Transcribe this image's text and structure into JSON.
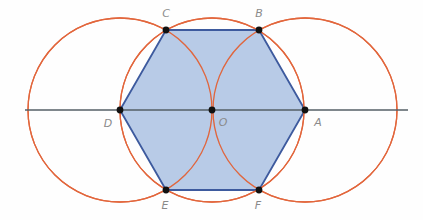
{
  "figure": {
    "width": 423,
    "height": 220
  },
  "colors": {
    "background": "#fefefe",
    "arc_stroke": "#e2663c",
    "hexagon_fill": "#aec4e4",
    "hexagon_stroke": "#3d5a9e",
    "axis_line": "#555f66",
    "point_fill": "#111111",
    "label_text": "#8a8a8a"
  },
  "axis": {
    "name": "horizontal-diameter-line",
    "x1": 25,
    "y1": 110,
    "x2": 408,
    "y2": 110
  },
  "center": {
    "label": "O",
    "x": 212,
    "y": 110,
    "label_x": 223,
    "label_y": 123
  },
  "radius": 92,
  "circles": [
    {
      "name": "circle-center-O",
      "cx": 212,
      "cy": 110,
      "r": 92
    },
    {
      "name": "circle-center-D",
      "cx": 120,
      "cy": 110,
      "r": 92
    },
    {
      "name": "circle-center-A",
      "cx": 305,
      "cy": 110,
      "r": 92
    }
  ],
  "vertices": [
    {
      "label": "A",
      "x": 305,
      "y": 110,
      "label_x": 318,
      "label_y": 123
    },
    {
      "label": "B",
      "x": 259,
      "y": 30,
      "label_x": 259,
      "label_y": 14
    },
    {
      "label": "C",
      "x": 166,
      "y": 30,
      "label_x": 166,
      "label_y": 14
    },
    {
      "label": "D",
      "x": 120,
      "y": 110,
      "label_x": 108,
      "label_y": 124
    },
    {
      "label": "E",
      "x": 166,
      "y": 190,
      "label_x": 165,
      "label_y": 206
    },
    {
      "label": "F",
      "x": 259,
      "y": 190,
      "label_x": 258,
      "label_y": 206
    }
  ],
  "hexagon": {
    "name": "regular-hexagon",
    "points": "305,110 259,30 166,30 120,110 166,190 259,190"
  }
}
